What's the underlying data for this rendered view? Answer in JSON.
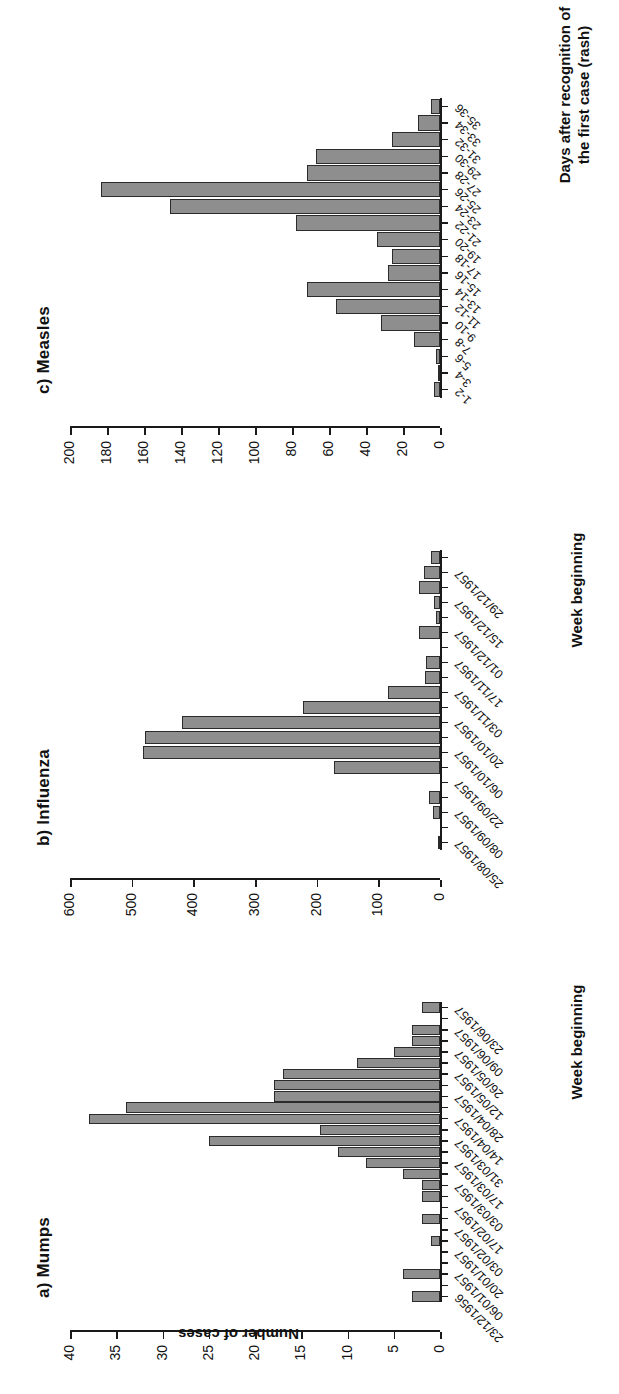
{
  "figure": {
    "ylabel_shared": "Number of cases"
  },
  "chart_data": [
    {
      "type": "bar",
      "panel_label": "a) Mumps",
      "title": "a) Mumps",
      "xlabel": "Week beginning",
      "ylabel": "Number of cases",
      "ylim": [
        0,
        40
      ],
      "yticks": [
        0,
        5,
        10,
        15,
        20,
        25,
        30,
        35,
        40
      ],
      "grid": false,
      "categories": [
        "23/12/1956",
        "30/12/1956",
        "06/01/1957",
        "13/01/1957",
        "20/01/1957",
        "27/01/1957",
        "03/02/1957",
        "10/02/1957",
        "17/02/1957",
        "24/02/1957",
        "03/03/1957",
        "10/03/1957",
        "17/03/1957",
        "24/03/1957",
        "31/03/1957",
        "07/04/1957",
        "14/04/1957",
        "21/04/1957",
        "28/04/1957",
        "05/05/1957",
        "12/05/1957",
        "19/05/1957",
        "26/05/1957",
        "02/06/1957",
        "09/06/1957",
        "16/06/1957",
        "23/06/1957"
      ],
      "tick_labels": [
        "23/12/1956",
        "06/01/1957",
        "20/01/1957",
        "03/02/1957",
        "17/02/1957",
        "03/03/1957",
        "17/03/1957",
        "31/03/1957",
        "14/04/1957",
        "28/04/1957",
        "12/05/1957",
        "26/05/1957",
        "09/06/1957",
        "23/06/1957"
      ],
      "values": [
        3,
        0,
        4,
        0,
        0,
        1,
        0,
        2,
        0,
        2,
        2,
        4,
        8,
        11,
        25,
        13,
        38,
        34,
        18,
        18,
        17,
        9,
        5,
        3,
        3,
        0,
        2
      ]
    },
    {
      "type": "bar",
      "panel_label": "b) Influenza",
      "title": "b) Influenza",
      "xlabel": "Week beginning",
      "ylabel": "Number of cases",
      "ylim": [
        0,
        600
      ],
      "yticks": [
        0,
        100,
        200,
        300,
        400,
        500,
        600
      ],
      "grid": false,
      "categories": [
        "25/08/1957",
        "01/09/1957",
        "08/09/1957",
        "15/09/1957",
        "22/09/1957",
        "29/09/1957",
        "06/10/1957",
        "13/10/1957",
        "20/10/1957",
        "27/10/1957",
        "03/11/1957",
        "10/11/1957",
        "17/11/1957",
        "24/11/1957",
        "01/12/1957",
        "08/12/1957",
        "15/12/1957",
        "22/12/1957",
        "29/12/1957",
        "05/01/1958"
      ],
      "tick_labels": [
        "25/08/1957",
        "08/09/1957",
        "22/09/1957",
        "06/10/1957",
        "20/10/1957",
        "03/11/1957",
        "17/11/1957",
        "01/12/1957",
        "15/12/1957",
        "29/12/1957"
      ],
      "values": [
        3,
        0,
        12,
        18,
        0,
        172,
        482,
        478,
        418,
        222,
        84,
        24,
        22,
        0,
        34,
        7,
        9,
        34,
        26,
        14
      ]
    },
    {
      "type": "bar",
      "panel_label": "c) Measles",
      "title": "c) Measles",
      "xlabel": "Days after recognition of\nthe first case (rash)",
      "ylabel": "Number of cases",
      "ylim": [
        0,
        200
      ],
      "yticks": [
        0,
        20,
        40,
        60,
        80,
        100,
        120,
        140,
        160,
        180,
        200
      ],
      "grid": false,
      "categories": [
        "1-2",
        "3-4",
        "5-6",
        "7-8",
        "9-10",
        "11-12",
        "13-14",
        "15-16",
        "17-18",
        "19-20",
        "21-22",
        "23-24",
        "25-26",
        "27-28",
        "29-30",
        "31-32",
        "33-34",
        "35-36"
      ],
      "values": [
        3,
        1,
        2,
        14,
        32,
        56,
        72,
        28,
        26,
        34,
        78,
        146,
        183,
        72,
        67,
        26,
        12,
        5
      ]
    }
  ]
}
